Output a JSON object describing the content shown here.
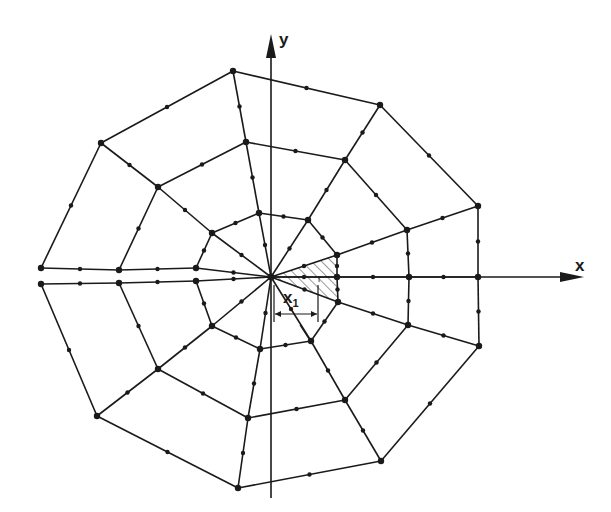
{
  "figure": {
    "axes": {
      "x_label": "x",
      "y_label": "y",
      "origin": [
        271,
        277
      ]
    },
    "annotations": {
      "x1_label": "x",
      "x1_subscript": "1",
      "r_label": "r"
    },
    "colors": {
      "line": "#1a1a1a",
      "hatch": "#333333",
      "background": "#ffffff"
    },
    "mesh": {
      "center": [
        271,
        277
      ],
      "rings": {
        "outer": [
          [
            233,
            71
          ],
          [
            380,
            105
          ],
          [
            478,
            206
          ],
          [
            478,
            277
          ],
          [
            479,
            346
          ],
          [
            381,
            461
          ],
          [
            238,
            488
          ],
          [
            97,
            416
          ],
          [
            41,
            284
          ],
          [
            41,
            268
          ],
          [
            101,
            143
          ]
        ],
        "middle": [
          [
            246,
            142
          ],
          [
            345,
            160
          ],
          [
            407,
            230
          ],
          [
            409,
            277
          ],
          [
            408,
            325
          ],
          [
            345,
            400
          ],
          [
            248,
            418
          ],
          [
            158,
            369
          ],
          [
            119,
            283
          ],
          [
            119,
            270
          ],
          [
            158,
            187
          ]
        ],
        "inner": [
          [
            259,
            213
          ],
          [
            308,
            220
          ],
          [
            337,
            255
          ],
          [
            337,
            277
          ],
          [
            338,
            302
          ],
          [
            311,
            341
          ],
          [
            260,
            349
          ],
          [
            212,
            326
          ],
          [
            196,
            281
          ],
          [
            196,
            268
          ],
          [
            212,
            233
          ]
        ]
      },
      "shaded_element": [
        [
          271,
          277
        ],
        [
          337,
          255
        ],
        [
          337,
          302
        ]
      ]
    }
  }
}
